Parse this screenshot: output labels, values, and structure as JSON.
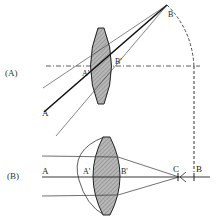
{
  "figure": {
    "panel_a": {
      "label": "(A)",
      "points": {
        "A": "A",
        "A_prime": "A'",
        "B_prime": "B'",
        "B": "B"
      }
    },
    "panel_b": {
      "label": "(B)",
      "points": {
        "A": "A",
        "A_prime": "A'",
        "B_prime": "B'",
        "C": "C",
        "B": "B"
      }
    },
    "colors": {
      "line": "#222222",
      "lens_fill": "#a8a8a8",
      "background": "#ffffff"
    }
  }
}
